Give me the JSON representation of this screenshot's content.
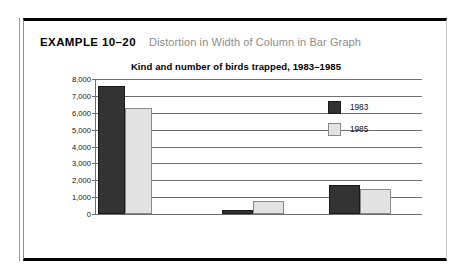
{
  "header": {
    "example_label": "EXAMPLE 10–20",
    "caption": "Distortion in Width of Column in Bar Graph"
  },
  "colors": {
    "series_1983": "#333333",
    "series_1985": "#e2e2e2",
    "gridline": "#6e6e6e",
    "frame": "#000000",
    "caption_text": "#8c8c8c"
  },
  "chart_data": {
    "type": "bar",
    "title": "Kind and number of birds trapped, 1983–1985",
    "xlabel": "Kind",
    "ylabel": "",
    "categories": [
      "Sparrows",
      "Blackbirds",
      "Starlings"
    ],
    "series": [
      {
        "name": "1983",
        "values": [
          7600,
          250,
          1700
        ]
      },
      {
        "name": "1985",
        "values": [
          6300,
          750,
          1500
        ]
      }
    ],
    "ylim": [
      0,
      8000
    ],
    "yticks": [
      8000,
      7000,
      6000,
      5000,
      4000,
      3000,
      2000,
      1000,
      0
    ],
    "ytick_labels": [
      "8,000",
      "7,000",
      "6,000",
      "5,000",
      "4,000",
      "3,000",
      "2,000",
      "1,000",
      "0"
    ],
    "grid": true,
    "legend_position": "inside-right",
    "bar_widths_note": "Sparrows columns drawn much wider than other categories",
    "bar_geometry": [
      {
        "category": "Sparrows",
        "x1983": 2,
        "x1985": 29,
        "width": 27
      },
      {
        "category": "Blackbirds",
        "x1983": 126,
        "x1985": 157,
        "width": 31
      },
      {
        "category": "Starlings",
        "x1983": 233,
        "x1985": 264,
        "width": 31
      }
    ]
  },
  "legend": {
    "items": [
      {
        "label": "1983",
        "swatch": "dark-swatch-icon"
      },
      {
        "label": "1985",
        "swatch": "light-swatch-icon"
      }
    ]
  }
}
